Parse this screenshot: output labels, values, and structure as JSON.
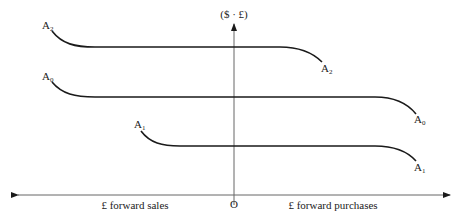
{
  "diagram": {
    "type": "forward-market-curves",
    "colors": {
      "line": "#1a1a1a",
      "axis": "#555555",
      "background": "#ffffff"
    },
    "y_axis": {
      "label": "($ · £)"
    },
    "x_axis": {
      "origin_label": "O",
      "left_label": "£ forward sales",
      "right_label": "£ forward purchases"
    },
    "curves": [
      {
        "id": "A2",
        "base": "A",
        "subscript": "2",
        "left_label": "A",
        "right_label": "A"
      },
      {
        "id": "A0",
        "base": "A",
        "subscript": "0",
        "left_label": "A",
        "right_label": "A"
      },
      {
        "id": "A1",
        "base": "A",
        "subscript": "1",
        "left_label": "A",
        "right_label": "A"
      }
    ]
  }
}
